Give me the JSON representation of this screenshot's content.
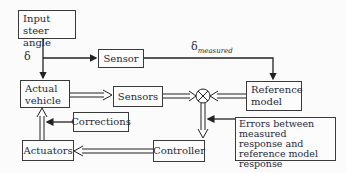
{
  "diagram": {
    "type": "block-diagram",
    "title": "",
    "blocks": {
      "input": {
        "label": "Input steer angle"
      },
      "sensor": {
        "label": "Sensor"
      },
      "reference": {
        "label": "Reference model"
      },
      "vehicle": {
        "label": "Actual vehicle"
      },
      "sensors": {
        "label": "Sensors"
      },
      "corrections": {
        "label": "Corrections"
      },
      "actuators": {
        "label": "Actuators"
      },
      "controller": {
        "label": "Controller"
      },
      "errors": {
        "label": "Errors between measured response and reference model response"
      }
    },
    "labels": {
      "delta": "δ",
      "delta_measured_base": "δ",
      "delta_measured_sub": "measured"
    },
    "summing_junction": {
      "symbol": "⊗"
    },
    "colors": {
      "line": "#222222",
      "box_border": "#3a3a3a",
      "text": "#1e2a3a"
    }
  }
}
